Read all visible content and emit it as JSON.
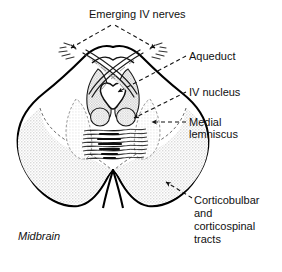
{
  "figure": {
    "title_label": "Emerging IV nerves",
    "region_label": "Midbrain",
    "labels": {
      "aqueduct": "Aqueduct",
      "iv_nucleus": "IV nucleus",
      "medial_line1": "Medial",
      "medial_line2": "lemniscus",
      "tracts_line1": "Corticobulbar",
      "tracts_line2": "and",
      "tracts_line3": "corticospinal",
      "tracts_line4": "tracts"
    },
    "colors": {
      "ink": "#111111",
      "outline": "#000000",
      "tract_fill": "#e9e9e9",
      "nigra_fill": "#efefef",
      "nucleus_fill": "#d8d8d8",
      "page_bg": "#ffffff"
    },
    "structures": [
      {
        "name": "midbrain-outline",
        "kind": "outline"
      },
      {
        "name": "cerebral-aqueduct",
        "kind": "cavity"
      },
      {
        "name": "periaqueductal-gray",
        "kind": "band"
      },
      {
        "name": "trochlear-decussation",
        "kind": "fiber-crossing"
      },
      {
        "name": "iv-nucleus-left",
        "kind": "nucleus"
      },
      {
        "name": "iv-nucleus-right",
        "kind": "nucleus"
      },
      {
        "name": "medial-lemniscus",
        "kind": "hatched-band"
      },
      {
        "name": "substantia-nigra-left",
        "kind": "shaded-band"
      },
      {
        "name": "substantia-nigra-right",
        "kind": "shaded-band"
      },
      {
        "name": "crus-cerebri-left",
        "kind": "shaded-lobe"
      },
      {
        "name": "crus-cerebri-right",
        "kind": "shaded-lobe"
      },
      {
        "name": "interpeduncular-fossa",
        "kind": "notch"
      },
      {
        "name": "emerging-iv-nerve-left",
        "kind": "rootlets"
      },
      {
        "name": "emerging-iv-nerve-right",
        "kind": "rootlets"
      }
    ]
  }
}
